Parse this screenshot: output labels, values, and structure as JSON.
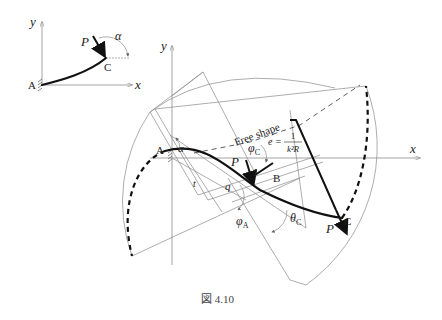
{
  "caption": "図 4.10",
  "inset": {
    "axis_y": "y",
    "axis_x": "x",
    "point_A": "A",
    "point_C": "C",
    "force": "P",
    "angle": "α"
  },
  "main": {
    "axis_y": "y",
    "axis_x": "x",
    "point_A": "A",
    "point_B": "B",
    "point_C": "C",
    "point_J": "J",
    "force_at_J": "P",
    "force_at_C": "P",
    "free_shape_label": "Free shape",
    "angle_alpha": "α",
    "angle_phi_C": "φ",
    "angle_phi_C_sub": "C",
    "angle_phi_A": "φ",
    "angle_phi_A_sub": "A",
    "angle_theta_C": "θ",
    "angle_theta_C_sub": "C",
    "length_t": "t",
    "length_q": "q",
    "eccentricity_lhs": "e =",
    "eccentricity_num": "1",
    "eccentricity_den": "k²R"
  }
}
